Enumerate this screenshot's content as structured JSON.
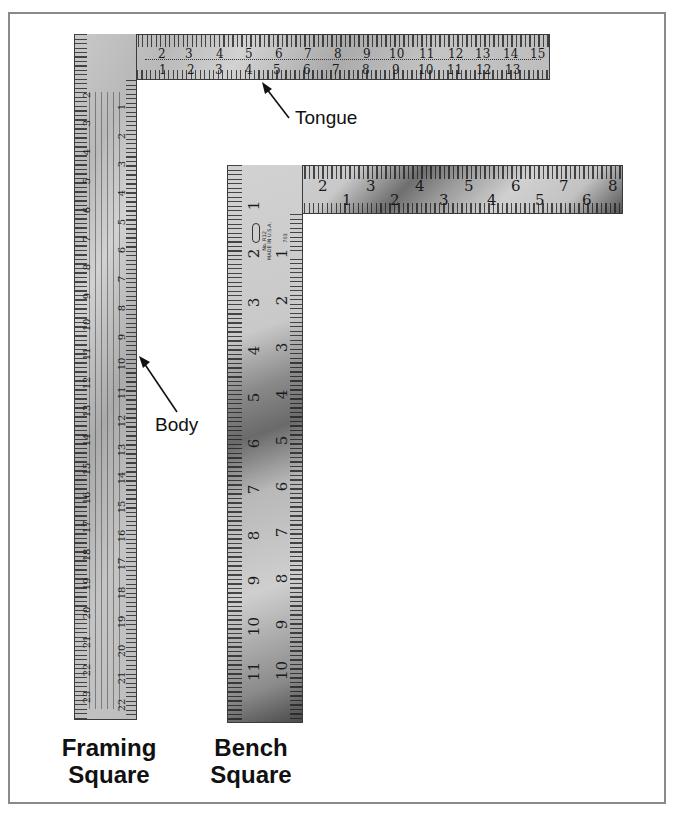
{
  "figure": {
    "border_color": "#8a8a8a",
    "background": "#ffffff"
  },
  "framing_square": {
    "caption_line1": "Framing",
    "caption_line2": "Square",
    "tongue_label": "Tongue",
    "body_label": "Body",
    "tongue_outer_scale": [
      "1",
      "2",
      "3",
      "4",
      "5",
      "6",
      "7",
      "8",
      "9",
      "10",
      "11",
      "12",
      "13",
      "14",
      "15"
    ],
    "tongue_inner_scale": [
      "1",
      "2",
      "3",
      "4",
      "5",
      "6",
      "7",
      "8",
      "9",
      "10",
      "11",
      "12",
      "13"
    ],
    "body_outer_scale": [
      "2",
      "3",
      "4",
      "5",
      "6",
      "7",
      "8",
      "9",
      "10",
      "11",
      "12",
      "13",
      "14",
      "15",
      "16",
      "17",
      "18",
      "19",
      "20",
      "21",
      "22",
      "23"
    ],
    "body_inner_scale": [
      "1",
      "2",
      "3",
      "4",
      "5",
      "6",
      "7",
      "8",
      "9",
      "10",
      "11",
      "12",
      "13",
      "14",
      "15",
      "16",
      "17",
      "18",
      "19",
      "20",
      "21",
      "22"
    ]
  },
  "bench_square": {
    "caption_line1": "Bench",
    "caption_line2": "Square",
    "tongue_outer_scale": [
      "1",
      "2",
      "3",
      "4",
      "5",
      "6",
      "7",
      "8"
    ],
    "tongue_inner_scale": [
      "1",
      "2",
      "3",
      "4",
      "5",
      "6"
    ],
    "body_outer_scale": [
      "1",
      "2",
      "3",
      "4",
      "5",
      "6",
      "7",
      "8",
      "9",
      "10",
      "11"
    ],
    "body_inner_scale": [
      "1",
      "2",
      "3",
      "4",
      "5",
      "6",
      "7",
      "8",
      "9",
      "10"
    ],
    "stamp_lines": [
      "No. R12",
      "MADE IN U.S.A.",
      "703"
    ]
  }
}
